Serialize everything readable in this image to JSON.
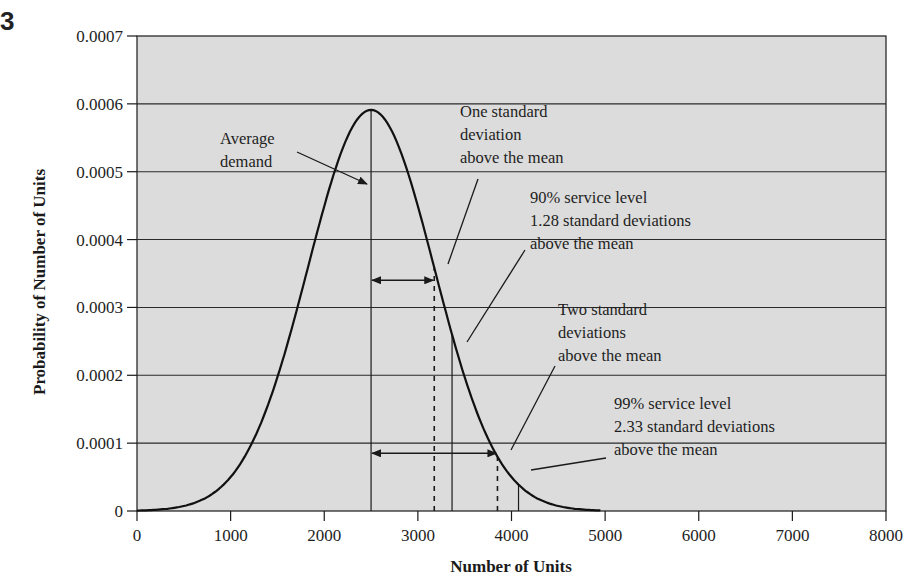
{
  "figure": {
    "label": "3"
  },
  "chart_data": {
    "type": "line",
    "title": "",
    "xlabel": "Number of Units",
    "ylabel": "Probability of Number of Units",
    "xlim": [
      0,
      8000
    ],
    "ylim": [
      0,
      0.0007
    ],
    "x_ticks": [
      "0",
      "1000",
      "2000",
      "3000",
      "4000",
      "5000",
      "6000",
      "7000",
      "8000"
    ],
    "y_ticks": [
      "0",
      "0.0001",
      "0.0002",
      "0.0003",
      "0.0004",
      "0.0005",
      "0.0006",
      "0.0007"
    ],
    "grid": {
      "horizontal": true,
      "vertical": false
    },
    "background": "#dcdcdc",
    "series": [
      {
        "name": "Normal demand distribution",
        "distribution": "normal",
        "mean": 2500,
        "std_dev": 675,
        "x": [
          0,
          250,
          500,
          750,
          1000,
          1250,
          1500,
          1750,
          2000,
          2250,
          2500,
          2750,
          3000,
          3250,
          3500,
          3750,
          4000,
          4250,
          4500,
          4750,
          5000
        ],
        "values": [
          1e-06,
          6e-06,
          7e-06,
          2e-05,
          5e-05,
          0.000105,
          0.000198,
          0.00032,
          0.00045,
          0.00055,
          0.000591,
          0.00055,
          0.00045,
          0.00032,
          0.000198,
          0.000105,
          5e-05,
          2e-05,
          7e-06,
          2e-06,
          0.0
        ]
      }
    ],
    "reference_lines": [
      {
        "name": "mean",
        "x": 2500,
        "style": "solid"
      },
      {
        "name": "one_std_dev",
        "x": 3175,
        "style": "dashed"
      },
      {
        "name": "service_90",
        "x": 3365,
        "style": "solid"
      },
      {
        "name": "two_std_dev",
        "x": 3850,
        "style": "dashed"
      },
      {
        "name": "service_99",
        "x": 4075,
        "style": "solid"
      }
    ],
    "range_arrows": [
      {
        "name": "one_std_dev_span",
        "from": 2500,
        "to": 3175,
        "y": 0.00034
      },
      {
        "name": "two_std_dev_span",
        "from": 2500,
        "to": 3850,
        "y": 8.5e-05
      }
    ],
    "annotations": [
      {
        "id": "avg",
        "lines": [
          "Average",
          "demand"
        ]
      },
      {
        "id": "one_sd",
        "lines": [
          "One standard",
          "deviation",
          "above the mean"
        ]
      },
      {
        "id": "sl90",
        "lines": [
          "90% service level",
          "1.28 standard deviations",
          "above the mean"
        ]
      },
      {
        "id": "two_sd",
        "lines": [
          "Two standard",
          "deviations",
          "above the mean"
        ]
      },
      {
        "id": "sl99",
        "lines": [
          "99% service level",
          "2.33 standard deviations",
          "above the mean"
        ]
      }
    ]
  }
}
